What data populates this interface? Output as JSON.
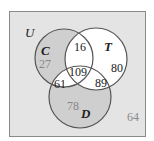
{
  "diagram": {
    "type": "venn-3",
    "universe_label": "U",
    "sets": [
      {
        "id": "C",
        "label": "C"
      },
      {
        "id": "T",
        "label": "T"
      },
      {
        "id": "D",
        "label": "D"
      }
    ],
    "regions": {
      "C_only": "27",
      "T_only": "80",
      "D_only": "78",
      "C_T_only": "16",
      "C_D_only": "61",
      "T_D_only": "89",
      "C_T_D": "109",
      "outside": "64"
    },
    "colors": {
      "background": "#e4e4e4",
      "shaded": "#cfcfcf",
      "unshaded": "#ffffff",
      "stroke": "#555555",
      "text_dark": "#222222",
      "text_gray": "#888888"
    }
  }
}
